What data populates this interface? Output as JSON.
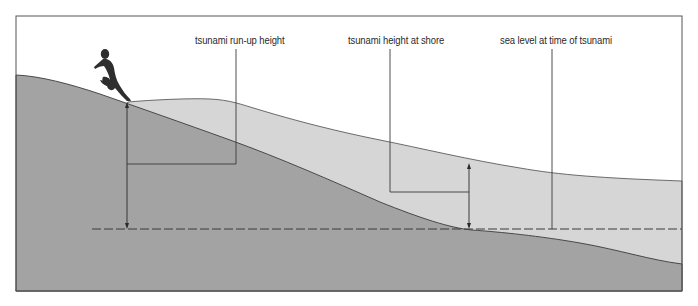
{
  "diagram": {
    "labels": {
      "runup": "tsunami run-up height",
      "shore_height": "tsunami height at shore",
      "sea_level": "sea level at time of tsunami"
    },
    "colors": {
      "background": "#ffffff",
      "land": "#a3a3a3",
      "water": "#d6d6d6",
      "line": "#3a3a3a",
      "frame": "#555555"
    },
    "figure": "running-person"
  }
}
